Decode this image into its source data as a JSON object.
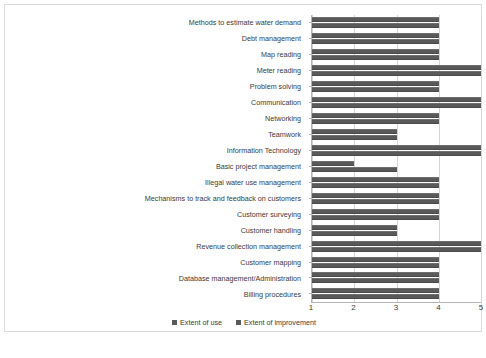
{
  "chart_data": {
    "type": "bar",
    "orientation": "horizontal",
    "title": "",
    "xlabel": "",
    "ylabel": "",
    "xlim": [
      1,
      5
    ],
    "xticks": [
      "1",
      "2",
      "3",
      "4",
      "5"
    ],
    "grid": true,
    "legend_position": "bottom",
    "categories": [
      "Methods to estimate water demand",
      "Debt management",
      "Map reading",
      "Meter reading",
      "Problem solving",
      "Communication",
      "Networking",
      "Teamwork",
      "Information Technology",
      "Basic project management",
      "Illegal water use management",
      "Mechanisms to track and feedback on customers",
      "Customer surveying",
      "Customer handling",
      "Revenue collection management",
      "Customer mapping",
      "Database management/Administration",
      "Billing procedures"
    ],
    "series": [
      {
        "name": "Extent of use",
        "values": [
          4,
          4,
          4,
          5,
          4,
          5,
          4,
          3,
          5,
          2,
          4,
          4,
          4,
          3,
          5,
          4,
          4,
          4
        ]
      },
      {
        "name": "Extent of improvement",
        "values": [
          4,
          4,
          4,
          5,
          4,
          5,
          4,
          3,
          5,
          3,
          4,
          4,
          4,
          3,
          5,
          4,
          4,
          4
        ]
      }
    ]
  },
  "legend": {
    "items": [
      {
        "label": "Extent of use",
        "color": "#595959"
      },
      {
        "label": "Extent of improvement",
        "color": "#595959"
      }
    ]
  },
  "colors": {
    "bar": "#595959",
    "gridline": "#d4d4d4",
    "axis": "#b5b5b5",
    "text": "#3a3a3a",
    "background": "#ffffff",
    "frame": "#dcdcdc"
  }
}
